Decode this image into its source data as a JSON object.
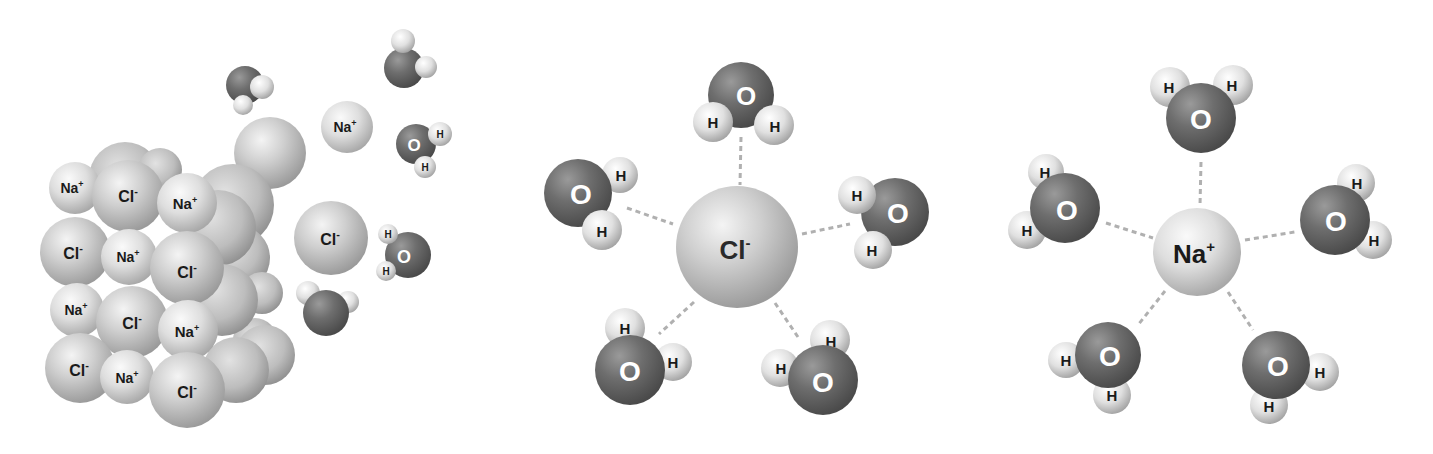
{
  "figure": {
    "panels": [
      {
        "id": "dissolving-crystal",
        "description": "NaCl crystal lattice dissolving in water",
        "lattice_front": [
          {
            "ion": "Na",
            "label": "Na",
            "charge": "+",
            "x": 75,
            "y": 188,
            "r": 26
          },
          {
            "ion": "Cl",
            "label": "Cl",
            "charge": "-",
            "x": 128,
            "y": 196,
            "r": 36
          },
          {
            "ion": "Na",
            "label": "Na",
            "charge": "+",
            "x": 187,
            "y": 203,
            "r": 30
          },
          {
            "ion": "Cl",
            "label": "Cl",
            "charge": "-",
            "x": 75,
            "y": 252,
            "r": 35
          },
          {
            "ion": "Na",
            "label": "Na",
            "charge": "+",
            "x": 129,
            "y": 257,
            "r": 28
          },
          {
            "ion": "Cl",
            "label": "Cl",
            "charge": "-",
            "x": 187,
            "y": 268,
            "r": 37
          },
          {
            "ion": "Na",
            "label": "Na",
            "charge": "+",
            "x": 77,
            "y": 310,
            "r": 27
          },
          {
            "ion": "Cl",
            "label": "Cl",
            "charge": "-",
            "x": 132,
            "y": 322,
            "r": 36
          },
          {
            "ion": "Na",
            "label": "Na",
            "charge": "+",
            "x": 188,
            "y": 330,
            "r": 30
          },
          {
            "ion": "Cl",
            "label": "Cl",
            "charge": "-",
            "x": 80,
            "y": 368,
            "r": 35
          },
          {
            "ion": "Na",
            "label": "Na",
            "charge": "+",
            "x": 127,
            "y": 377,
            "r": 27
          },
          {
            "ion": "Cl",
            "label": "Cl",
            "charge": "-",
            "x": 187,
            "y": 390,
            "r": 38
          }
        ],
        "free_ions": [
          {
            "ion": "Na",
            "label": "Na",
            "charge": "+",
            "x": 347,
            "y": 127,
            "r": 26
          },
          {
            "ion": "Cl",
            "label": "Cl",
            "charge": "-",
            "x": 331,
            "y": 238,
            "r": 37
          }
        ],
        "water_labels": {
          "oxygen": "O",
          "hydrogen": "H"
        }
      },
      {
        "id": "hydrated-chloride",
        "center_ion": {
          "label": "Cl",
          "charge": "-",
          "x": 737,
          "y": 247,
          "r": 61
        },
        "water_count": 5,
        "water_labels": {
          "oxygen": "O",
          "hydrogen": "H"
        }
      },
      {
        "id": "hydrated-sodium",
        "center_ion": {
          "label": "Na",
          "charge": "+",
          "x": 1197,
          "y": 252,
          "r": 44
        },
        "water_count": 5,
        "water_labels": {
          "oxygen": "O",
          "hydrogen": "H"
        }
      }
    ],
    "colors": {
      "background": "#ffffff",
      "chloride": "#c8c8c8",
      "sodium": "#dcdcdc",
      "oxygen": "#6e6e6e",
      "hydrogen": "#e4e4e4",
      "label_dark": "#1a1a1a",
      "label_light": "#ffffff",
      "bond_dash": "#b0b0b0"
    }
  }
}
